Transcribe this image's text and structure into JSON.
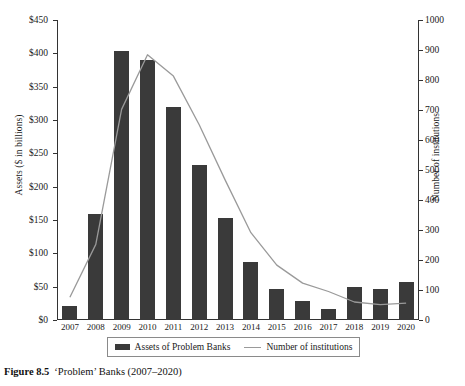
{
  "caption": {
    "figure_number": "Figure 8.5",
    "text": "‘Problem’ Banks (2007–2020)"
  },
  "legend": {
    "bars_label": "Assets of Problem Banks",
    "line_label": "Number of institutions"
  },
  "colors": {
    "bar": "#3a3a3a",
    "line": "#9a9a9a",
    "axis": "#333333",
    "background": "#ffffff"
  },
  "chart_data": {
    "type": "bar",
    "title": "‘Problem’ Banks (2007–2020)",
    "xlabel": "",
    "ylabel": "Assets ($ in billions)",
    "y2label": "Number of institutions",
    "ylim": [
      0,
      450
    ],
    "y2lim": [
      0,
      1000
    ],
    "yticks": [
      0,
      50,
      100,
      150,
      200,
      250,
      300,
      350,
      400,
      450
    ],
    "ytick_labels": [
      "$0",
      "$50",
      "$100",
      "$150",
      "$200",
      "$250",
      "$300",
      "$350",
      "$400",
      "$450"
    ],
    "y2ticks": [
      0,
      100,
      200,
      300,
      400,
      500,
      600,
      700,
      800,
      900,
      1000
    ],
    "y2tick_labels": [
      "0",
      "100",
      "200",
      "300",
      "400",
      "500",
      "600",
      "700",
      "800",
      "900",
      "1000"
    ],
    "grid": false,
    "legend_position": "bottom",
    "categories": [
      "2007",
      "2008",
      "2009",
      "2010",
      "2011",
      "2012",
      "2013",
      "2014",
      "2015",
      "2016",
      "2017",
      "2018",
      "2019",
      "2020"
    ],
    "series": [
      {
        "name": "Assets of Problem Banks",
        "type": "bar",
        "axis": "left",
        "unit": "$ billions",
        "values": [
          21,
          159,
          403,
          390,
          319,
          233,
          153,
          87,
          47,
          28,
          17,
          50,
          47,
          57
        ]
      },
      {
        "name": "Number of institutions",
        "type": "line",
        "axis": "right",
        "unit": "institutions",
        "values": [
          76,
          252,
          702,
          884,
          813,
          651,
          467,
          291,
          183,
          123,
          95,
          60,
          51,
          56
        ]
      }
    ]
  }
}
